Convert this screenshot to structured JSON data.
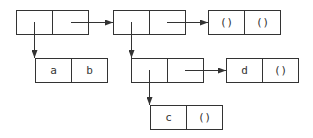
{
  "diagram": {
    "type": "box-and-pointer",
    "colors": {
      "line": "#333333",
      "background": "#ffffff",
      "text": "#333333"
    },
    "pairs": [
      {
        "id": "p1",
        "x": 16,
        "y": 10,
        "car": "",
        "cdr": ""
      },
      {
        "id": "p2",
        "x": 113,
        "y": 10,
        "car": "",
        "cdr": ""
      },
      {
        "id": "p3",
        "x": 208,
        "y": 10,
        "car": "()",
        "cdr": "()"
      },
      {
        "id": "p4",
        "x": 35,
        "y": 58,
        "car": "a",
        "cdr": "b"
      },
      {
        "id": "p5",
        "x": 131,
        "y": 58,
        "car": "",
        "cdr": ""
      },
      {
        "id": "p6",
        "x": 226,
        "y": 58,
        "car": "d",
        "cdr": "()"
      },
      {
        "id": "p7",
        "x": 150,
        "y": 105,
        "car": "c",
        "cdr": "()"
      }
    ],
    "pointers": [
      {
        "from": "p1.cdr",
        "to": "p2"
      },
      {
        "from": "p1.car",
        "to": "p4"
      },
      {
        "from": "p2.cdr",
        "to": "p3"
      },
      {
        "from": "p2.car",
        "to": "p5"
      },
      {
        "from": "p5.cdr",
        "to": "p6"
      },
      {
        "from": "p5.car",
        "to": "p7"
      }
    ]
  }
}
